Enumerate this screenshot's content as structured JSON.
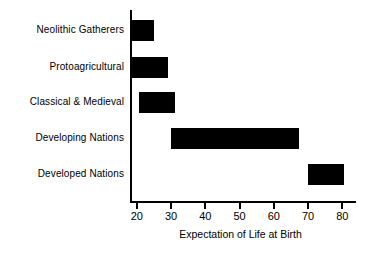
{
  "chart_data": {
    "type": "bar",
    "orientation": "horizontal",
    "title": "",
    "xlabel": "Expectation of Life at Birth",
    "ylabel": "",
    "xlim": [
      18,
      84
    ],
    "xticks": [
      20,
      30,
      40,
      50,
      60,
      70,
      80
    ],
    "xticklabels": [
      "20",
      "30",
      "40",
      "50",
      "60",
      "70",
      "80"
    ],
    "grid": false,
    "legend": "none",
    "bar_color": "#000000",
    "categories": [
      "Neolithic Gatherers",
      "Protoagricultural",
      "Classical & Medieval",
      "Developing Nations",
      "Developed Nations"
    ],
    "ranges": [
      {
        "category": "Neolithic Gatherers",
        "start": 18.0,
        "end": 25.0
      },
      {
        "category": "Protoagricultural",
        "start": 18.0,
        "end": 29.0
      },
      {
        "category": "Classical & Medieval",
        "start": 20.5,
        "end": 31.0
      },
      {
        "category": "Developing Nations",
        "start": 30.0,
        "end": 67.5
      },
      {
        "category": "Developed Nations",
        "start": 70.0,
        "end": 80.5
      }
    ],
    "values": [
      25.0,
      29.0,
      31.0,
      67.5,
      80.5
    ]
  }
}
